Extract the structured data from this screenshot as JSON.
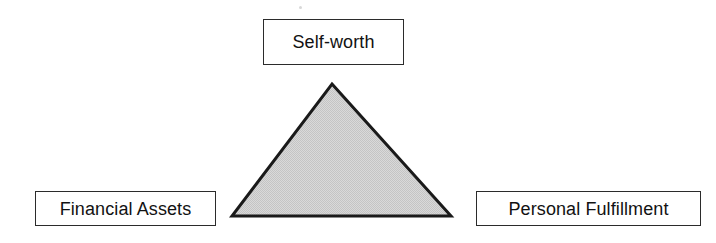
{
  "diagram": {
    "type": "triangle-relationship-diagram",
    "background_color": "#ffffff",
    "nodes": [
      {
        "id": "apex",
        "label": "Self-worth",
        "position": "top"
      },
      {
        "id": "left-base",
        "label": "Financial Assets",
        "position": "bottom-left"
      },
      {
        "id": "right-base",
        "label": "Personal Fulfillment",
        "position": "bottom-right"
      }
    ],
    "shape": {
      "name": "shaded-triangle",
      "fill_color": "#d4d4d4",
      "stroke_color": "#1a1a1a",
      "stroke_width": 3,
      "vertices": [
        {
          "x": 332,
          "y": 84
        },
        {
          "x": 451,
          "y": 216
        },
        {
          "x": 232,
          "y": 216
        }
      ]
    },
    "box_style": {
      "fill_color": "#ffffff",
      "border_color": "#2b2b2b",
      "text_color": "#121212"
    }
  }
}
